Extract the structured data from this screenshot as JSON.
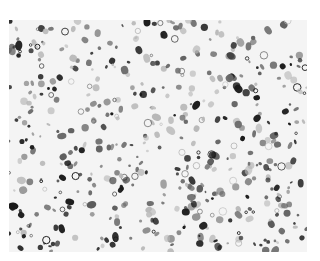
{
  "image": {
    "description": "Grayscale microscopy image of densely scattered stained cells",
    "palette": {
      "background": "#f4f4f4",
      "dark": "#1a1a1a",
      "mid": "#6a6a6a",
      "light": "#b8b8b8"
    },
    "blob_count": 520,
    "seed": 7
  }
}
